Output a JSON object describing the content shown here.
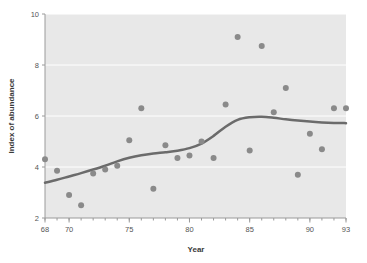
{
  "chart_data": {
    "type": "scatter",
    "title": "",
    "xlabel": "Year",
    "ylabel": "Index of abundance",
    "xlim": [
      68,
      93
    ],
    "ylim": [
      2,
      10
    ],
    "grid": true,
    "legend": "none",
    "xticks": [
      68,
      70,
      75,
      80,
      85,
      90,
      93
    ],
    "xtick_labels": [
      "68",
      "70",
      "75",
      "80",
      "85",
      "90",
      "93"
    ],
    "xminor_ticks": [
      68,
      69,
      70,
      71,
      72,
      73,
      74,
      75,
      76,
      77,
      78,
      79,
      80,
      81,
      82,
      83,
      84,
      85,
      86,
      87,
      88,
      89,
      90,
      91,
      92,
      93
    ],
    "yticks": [
      2,
      4,
      6,
      8,
      10
    ],
    "ytick_labels": [
      "2",
      "4",
      "6",
      "8",
      "10"
    ],
    "x": [
      68,
      69,
      70,
      71,
      72,
      73,
      74,
      75,
      76,
      77,
      78,
      79,
      80,
      81,
      82,
      83,
      84,
      85,
      86,
      87,
      88,
      89,
      90,
      91,
      92,
      93
    ],
    "values": [
      4.3,
      3.85,
      2.9,
      2.5,
      3.75,
      3.9,
      4.05,
      5.05,
      6.3,
      3.15,
      4.85,
      4.35,
      4.45,
      5.0,
      4.35,
      6.45,
      9.1,
      4.65,
      8.75,
      6.15,
      7.1,
      3.7,
      5.3,
      4.7,
      6.3,
      6.3
    ],
    "series": [
      {
        "name": "Index of abundance",
        "type": "scatter",
        "x": [
          68,
          69,
          70,
          71,
          72,
          73,
          74,
          75,
          76,
          77,
          78,
          79,
          80,
          81,
          82,
          83,
          84,
          85,
          86,
          87,
          88,
          89,
          90,
          91,
          92,
          93
        ],
        "values": [
          4.3,
          3.85,
          2.9,
          2.5,
          3.75,
          3.9,
          4.05,
          5.05,
          6.3,
          3.15,
          4.85,
          4.35,
          4.45,
          5.0,
          4.35,
          6.45,
          9.1,
          4.65,
          8.75,
          6.15,
          7.1,
          3.7,
          5.3,
          4.7,
          6.3,
          6.3
        ],
        "marker_color": "#8a8a8a",
        "marker_size": 6
      },
      {
        "name": "smoothed trend",
        "type": "line",
        "x": [
          68,
          69,
          70,
          71,
          72,
          73,
          74,
          75,
          76,
          77,
          78,
          79,
          80,
          81,
          82,
          83,
          84,
          85,
          86,
          87,
          88,
          89,
          90,
          91,
          92,
          93
        ],
        "values": [
          3.38,
          3.5,
          3.63,
          3.76,
          3.9,
          4.05,
          4.22,
          4.36,
          4.46,
          4.53,
          4.58,
          4.64,
          4.74,
          4.92,
          5.22,
          5.58,
          5.85,
          5.95,
          5.97,
          5.93,
          5.87,
          5.82,
          5.78,
          5.75,
          5.73,
          5.72
        ],
        "line_color": "#6b6b6b",
        "line_width": 2.5
      }
    ]
  },
  "style": {
    "plot_background": "#e8e8e8",
    "page_background": "#ffffff",
    "grid_color": "#ffffff",
    "axis_color": "#9a9a9a",
    "point_color": "#8a8a8a",
    "line_color": "#6b6b6b",
    "tick_label_color": "#555555",
    "axis_title_color": "#3a3a3a"
  }
}
